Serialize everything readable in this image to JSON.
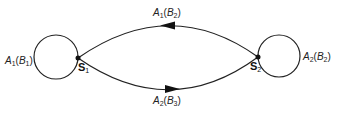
{
  "diagram": {
    "type": "state-transition",
    "states": [
      {
        "id": "S1",
        "name": "S",
        "sub": "1",
        "self_loop": {
          "action": "A",
          "action_sub": "1",
          "param": "B",
          "param_sub": "1"
        }
      },
      {
        "id": "S2",
        "name": "S",
        "sub": "2",
        "self_loop": {
          "action": "A",
          "action_sub": "2",
          "param": "B",
          "param_sub": "2"
        }
      }
    ],
    "transitions": [
      {
        "from": "S2",
        "to": "S1",
        "action": "A",
        "action_sub": "1",
        "param": "B",
        "param_sub": "2"
      },
      {
        "from": "S1",
        "to": "S2",
        "action": "A",
        "action_sub": "2",
        "param": "B",
        "param_sub": "3"
      }
    ]
  }
}
